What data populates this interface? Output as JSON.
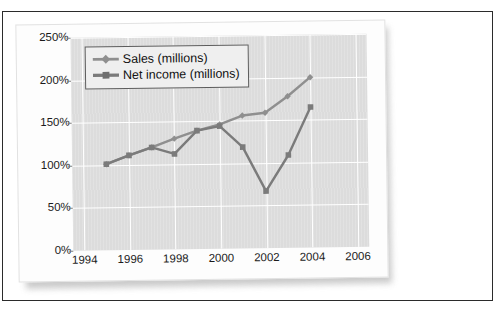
{
  "chart_data": {
    "type": "line",
    "title": "",
    "xlabel": "",
    "ylabel": "",
    "x": [
      1995,
      1996,
      1997,
      1998,
      1999,
      2000,
      2001,
      2002,
      2003,
      2004
    ],
    "xlim": [
      1993.5,
      2006.5
    ],
    "ylim": [
      0,
      250
    ],
    "ytick_labels": [
      "0%",
      "50%",
      "100%",
      "150%",
      "200%",
      "250%"
    ],
    "ytick_values": [
      0,
      50,
      100,
      150,
      200,
      250
    ],
    "xtick_labels": [
      "1994",
      "1996",
      "1998",
      "2000",
      "2002",
      "2004",
      "2006"
    ],
    "xtick_values": [
      1994,
      1996,
      1998,
      2000,
      2002,
      2004,
      2006
    ],
    "grid": true,
    "legend_position": "top-left",
    "series": [
      {
        "name": "Sales (millions)",
        "marker": "diamond",
        "color": "#8f8f8f",
        "values": [
          101,
          111,
          120,
          130,
          139,
          146,
          156,
          159,
          178,
          200
        ]
      },
      {
        "name": "Net income (millions)",
        "marker": "square",
        "color": "#7b7b7b",
        "values": [
          101,
          111,
          120,
          112,
          139,
          144,
          119,
          67,
          109,
          165
        ]
      }
    ]
  },
  "legend": {
    "items": [
      {
        "label": "Sales (millions)"
      },
      {
        "label": "Net income (millions)"
      }
    ]
  },
  "axes": {
    "y_labels": [
      "250%",
      "200%",
      "150%",
      "100%",
      "50%",
      "0%"
    ],
    "x_labels": [
      "1994",
      "1996",
      "1998",
      "2000",
      "2002",
      "2004",
      "2006"
    ]
  },
  "colors": {
    "plot_background": "#dcdcdc",
    "gridline": "#ffffff",
    "sales": "#8f8f8f",
    "net_income": "#7b7b7b",
    "page_border": "#2b2b2b"
  }
}
